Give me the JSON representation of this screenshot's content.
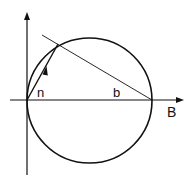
{
  "diagram": {
    "type": "geometric-construction",
    "labels": {
      "vector": "n",
      "chord": "b",
      "axis": "B"
    },
    "colors": {
      "stroke": "#111111",
      "background": "#ffffff"
    }
  }
}
